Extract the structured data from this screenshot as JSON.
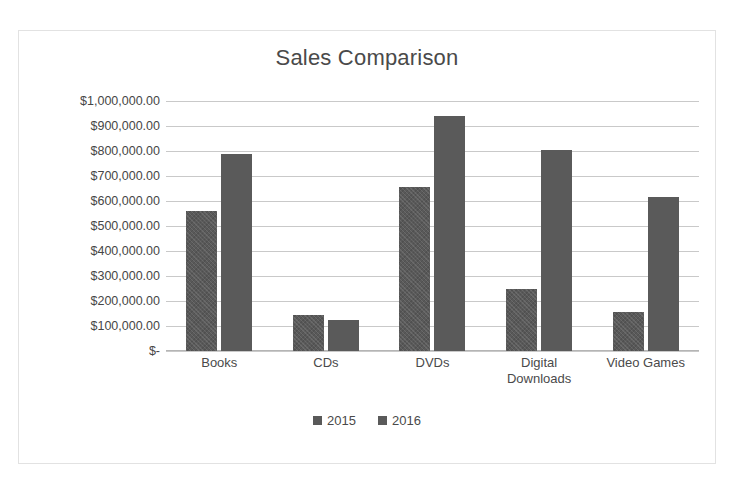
{
  "scan": {
    "top_cut_text": ""
  },
  "chart_data": {
    "type": "bar",
    "title": "Sales Comparison",
    "xlabel": "",
    "ylabel": "",
    "categories": [
      "Books",
      "CDs",
      "DVDs",
      "Digital Downloads",
      "Video Games"
    ],
    "series": [
      {
        "name": "2015",
        "values": [
          560000,
          145000,
          655000,
          250000,
          155000
        ]
      },
      {
        "name": "2016",
        "values": [
          790000,
          125000,
          940000,
          805000,
          615000
        ]
      }
    ],
    "ylim": [
      0,
      1000000
    ],
    "ytick_values": [
      1000000,
      900000,
      800000,
      700000,
      600000,
      500000,
      400000,
      300000,
      200000,
      100000,
      0
    ],
    "ytick_labels": [
      "$1,000,000.00",
      "$900,000.00",
      "$800,000.00",
      "$700,000.00",
      "$600,000.00",
      "$500,000.00",
      "$400,000.00",
      "$300,000.00",
      "$200,000.00",
      "$100,000.00",
      "$-"
    ],
    "grid": true,
    "legend": {
      "position": "bottom",
      "entries": [
        "2015",
        "2016"
      ]
    },
    "colors": {
      "series_2015": "#595959",
      "series_2016": "#5a5a5a",
      "gridline": "#c9c9c9",
      "text": "#4a4a4a",
      "border": "#e2e2e2"
    }
  }
}
